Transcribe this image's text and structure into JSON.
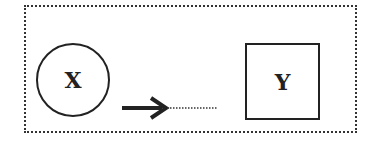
{
  "diagram": {
    "nodes": [
      {
        "id": "x",
        "label": "X",
        "shape": "circle"
      },
      {
        "id": "y",
        "label": "Y",
        "shape": "square"
      }
    ],
    "edges": [
      {
        "from": "x",
        "to": "y",
        "style": "solid-arrow-then-dotted",
        "direction": "right"
      }
    ],
    "frame": {
      "style": "dotted"
    },
    "colors": {
      "stroke": "#222222",
      "background": "#ffffff"
    }
  }
}
